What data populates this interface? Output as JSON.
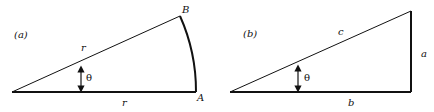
{
  "diagram": {
    "panels": [
      {
        "id": "a",
        "tag": "(a)",
        "shape": "circular sector",
        "labels": {
          "vertex_B": "B",
          "vertex_A": "A",
          "radius_upper": "r",
          "radius_lower": "r",
          "angle": "θ"
        }
      },
      {
        "id": "b",
        "tag": "(b)",
        "shape": "right triangle",
        "labels": {
          "hypotenuse": "c",
          "opposite": "a",
          "adjacent": "b",
          "angle": "θ"
        }
      }
    ],
    "colors": {
      "stroke": "#111111",
      "background": "#ffffff"
    }
  }
}
